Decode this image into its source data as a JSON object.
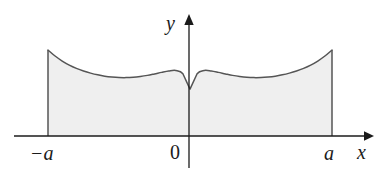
{
  "figure": {
    "kind": "shaded-area-under-curve",
    "background_color": "#ffffff",
    "axes": {
      "x_axis": {
        "label": "x",
        "icon": "arrow-right-icon",
        "y_pixel": 136,
        "x_start": 14,
        "x_end": 370
      },
      "y_axis": {
        "label": "y",
        "icon": "arrow-up-icon",
        "x_pixel": 189,
        "y_top": 16,
        "y_bottom": 168
      },
      "origin_label": "0"
    },
    "tick_labels": {
      "left": "−a",
      "origin": "0",
      "right": "a"
    },
    "region": {
      "fill_color": "#efefef",
      "stroke_color": "#555555",
      "stroke_width": 1.4,
      "left_bound_label": "−a",
      "right_bound_label": "a"
    }
  },
  "chart_data": {
    "type": "area",
    "title": "",
    "xlabel": "x",
    "ylabel": "y",
    "xlim": [
      -1,
      1
    ],
    "ylim": [
      0,
      1
    ],
    "grid": false,
    "legend": null,
    "x_tick_labels": [
      "−a",
      "0",
      "a"
    ],
    "x_tick_values": [
      -1,
      0,
      1
    ],
    "y_tick_labels": [],
    "series": [
      {
        "name": "f(x)",
        "fill": "#efefef",
        "stroke": "#555555",
        "x": [
          -1.0,
          -0.95,
          -0.9,
          -0.85,
          -0.8,
          -0.75,
          -0.7,
          -0.65,
          -0.6,
          -0.55,
          -0.5,
          -0.45,
          -0.4,
          -0.35,
          -0.3,
          -0.25,
          -0.2,
          -0.15,
          -0.1,
          -0.05,
          0.0,
          0.05,
          0.1,
          0.15,
          0.2,
          0.25,
          0.3,
          0.35,
          0.4,
          0.45,
          0.5,
          0.55,
          0.6,
          0.65,
          0.7,
          0.75,
          0.8,
          0.85,
          0.9,
          0.95,
          1.0
        ],
        "y": [
          1.0,
          0.93,
          0.872,
          0.825,
          0.787,
          0.756,
          0.731,
          0.711,
          0.696,
          0.686,
          0.68,
          0.679,
          0.683,
          0.692,
          0.705,
          0.722,
          0.74,
          0.756,
          0.762,
          0.724,
          0.545,
          0.724,
          0.762,
          0.756,
          0.74,
          0.722,
          0.705,
          0.692,
          0.683,
          0.679,
          0.68,
          0.686,
          0.696,
          0.711,
          0.731,
          0.756,
          0.787,
          0.825,
          0.872,
          0.93,
          1.0
        ]
      }
    ],
    "annotations": [
      {
        "name": "cusp-minimum",
        "x": 0.0,
        "y": 0.545
      },
      {
        "name": "local-maximum-left",
        "x": -0.13,
        "y": 0.762
      },
      {
        "name": "local-maximum-right",
        "x": 0.13,
        "y": 0.762
      },
      {
        "name": "local-minimum-left",
        "x": -0.45,
        "y": 0.679
      },
      {
        "name": "local-minimum-right",
        "x": 0.45,
        "y": 0.679
      },
      {
        "name": "endpoint-left",
        "x": -1.0,
        "y": 1.0
      },
      {
        "name": "endpoint-right",
        "x": 1.0,
        "y": 1.0
      }
    ]
  }
}
